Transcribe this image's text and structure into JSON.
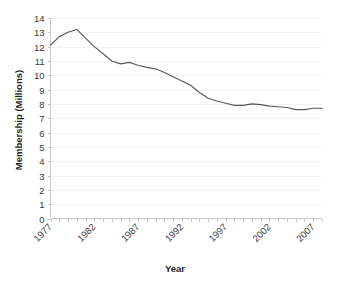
{
  "chart_data": {
    "type": "line",
    "title": "",
    "xlabel": "Year",
    "ylabel": "Membership (Millions)",
    "xlim": [
      1977,
      2008
    ],
    "ylim": [
      0,
      14
    ],
    "y_ticks": [
      0,
      1,
      2,
      3,
      4,
      5,
      6,
      7,
      8,
      9,
      10,
      11,
      12,
      13,
      14
    ],
    "x_ticks": [
      1977,
      1982,
      1987,
      1992,
      1997,
      2002,
      2007
    ],
    "x_minor_tick_interval": 1,
    "grid": "horizontal-faint",
    "legend": "none",
    "line_color": "#595959",
    "background_color": "#ffffff",
    "x": [
      1977,
      1978,
      1979,
      1980,
      1981,
      1982,
      1983,
      1984,
      1985,
      1986,
      1987,
      1988,
      1989,
      1990,
      1991,
      1992,
      1993,
      1994,
      1995,
      1996,
      1997,
      1998,
      1999,
      2000,
      2001,
      2002,
      2003,
      2004,
      2005,
      2006,
      2007,
      2008
    ],
    "values": [
      12.1,
      12.7,
      13.0,
      13.2,
      12.6,
      12.0,
      11.5,
      11.0,
      10.8,
      10.9,
      10.7,
      10.55,
      10.45,
      10.2,
      9.9,
      9.6,
      9.3,
      8.8,
      8.4,
      8.2,
      8.05,
      7.9,
      7.9,
      8.0,
      7.95,
      7.85,
      7.8,
      7.75,
      7.6,
      7.6,
      7.7,
      7.7
    ],
    "series": [
      {
        "name": "Membership",
        "values": [
          12.1,
          12.7,
          13.0,
          13.2,
          12.6,
          12.0,
          11.5,
          11.0,
          10.8,
          10.9,
          10.7,
          10.55,
          10.45,
          10.2,
          9.9,
          9.6,
          9.3,
          8.8,
          8.4,
          8.2,
          8.05,
          7.9,
          7.9,
          8.0,
          7.95,
          7.85,
          7.8,
          7.75,
          7.6,
          7.6,
          7.7,
          7.7
        ]
      }
    ]
  },
  "axis": {
    "y_title": "Membership (Millions)",
    "x_title": "Year",
    "y_tick_labels": [
      "14",
      "13",
      "12",
      "11",
      "10",
      "9",
      "8",
      "7",
      "6",
      "5",
      "4",
      "3",
      "2",
      "1",
      "0"
    ],
    "x_tick_labels": [
      "1977",
      "1982",
      "1987",
      "1992",
      "1997",
      "2002",
      "2007"
    ]
  }
}
